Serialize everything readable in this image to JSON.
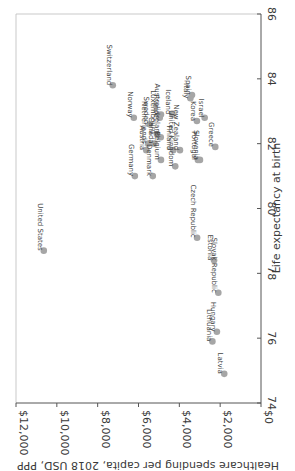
{
  "chart_data": {
    "type": "scatter",
    "title": "",
    "xlabel": "Healthcare spending per capita, 2018 USD, PPP",
    "ylabel": "Life expectancy at birth",
    "xlim": [
      0,
      12000
    ],
    "ylim": [
      74,
      86
    ],
    "x_ticks": [
      "$12,000",
      "$10,000",
      "$8,000",
      "$6,000",
      "$4,000",
      "$2,000",
      "$0"
    ],
    "x_tick_values": [
      12000,
      10000,
      8000,
      6000,
      4000,
      2000,
      0
    ],
    "y_ticks": [
      "74",
      "76",
      "78",
      "80",
      "82",
      "84",
      "86"
    ],
    "y_tick_values": [
      74,
      76,
      78,
      80,
      82,
      84,
      86
    ],
    "grid": false,
    "orientation": "rotated 90 degrees clockwise",
    "marker_color": "#a6a6a6",
    "points": [
      {
        "label": "United States",
        "x": 10640,
        "y": 78.7
      },
      {
        "label": "Switzerland",
        "x": 7260,
        "y": 83.8
      },
      {
        "label": "Norway",
        "x": 6230,
        "y": 82.8
      },
      {
        "label": "Germany",
        "x": 6180,
        "y": 81.0
      },
      {
        "label": "Netherlands",
        "x": 5520,
        "y": 82.0
      },
      {
        "label": "Austria",
        "x": 5620,
        "y": 81.8
      },
      {
        "label": "Sweden",
        "x": 5450,
        "y": 82.6
      },
      {
        "label": "Denmark",
        "x": 5300,
        "y": 81.0
      },
      {
        "label": "Canada",
        "x": 5220,
        "y": 82.0
      },
      {
        "label": "Luxembourg",
        "x": 5100,
        "y": 82.3
      },
      {
        "label": "France",
        "x": 4960,
        "y": 82.8
      },
      {
        "label": "Belgium",
        "x": 4900,
        "y": 81.5
      },
      {
        "label": "Australia",
        "x": 4900,
        "y": 82.9
      },
      {
        "label": "Ireland",
        "x": 4910,
        "y": 82.2
      },
      {
        "label": "Iceland",
        "x": 4340,
        "y": 82.9
      },
      {
        "label": "Finland",
        "x": 4300,
        "y": 81.8
      },
      {
        "label": "New Zealand",
        "x": 3970,
        "y": 81.8
      },
      {
        "label": "United Kingdom",
        "x": 4200,
        "y": 81.3
      },
      {
        "label": "Italy",
        "x": 3460,
        "y": 83.4
      },
      {
        "label": "Spain",
        "x": 3380,
        "y": 83.5
      },
      {
        "label": "Israel",
        "x": 2760,
        "y": 82.8
      },
      {
        "label": "Korea",
        "x": 3140,
        "y": 82.7
      },
      {
        "label": "Slovenia",
        "x": 2990,
        "y": 81.5
      },
      {
        "label": "Portugal",
        "x": 3090,
        "y": 81.5
      },
      {
        "label": "Greece",
        "x": 2240,
        "y": 81.9
      },
      {
        "label": "Czech Republic",
        "x": 3130,
        "y": 79.1
      },
      {
        "label": "Estonia",
        "x": 2300,
        "y": 78.4
      },
      {
        "label": "Slovak Republic",
        "x": 2090,
        "y": 77.4
      },
      {
        "label": "Hungary",
        "x": 2160,
        "y": 76.2
      },
      {
        "label": "Lithuania",
        "x": 2380,
        "y": 75.9
      },
      {
        "label": "Latvia",
        "x": 1800,
        "y": 74.9
      }
    ]
  }
}
